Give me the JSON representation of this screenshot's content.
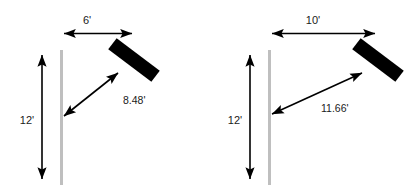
{
  "figure": {
    "title": "",
    "type": "geometry-diagram",
    "unit_symbol": "'",
    "colors": {
      "ink": "#000000",
      "wall": "#bfbfbf",
      "board": "#000000",
      "background": "#ffffff"
    }
  },
  "diagrams": [
    {
      "id": "left",
      "name": "ladder-diagram-left",
      "labels": {
        "horizontal": "6'",
        "vertical": "12'",
        "diagonal": "8.48'"
      },
      "measurements": {
        "horizontal_ft": 6,
        "vertical_ft": 12,
        "diagonal_ft": 8.48
      }
    },
    {
      "id": "right",
      "name": "ladder-diagram-right",
      "labels": {
        "horizontal": "10'",
        "vertical": "12'",
        "diagonal": "11.66'"
      },
      "measurements": {
        "horizontal_ft": 10,
        "vertical_ft": 12,
        "diagonal_ft": 11.66
      }
    }
  ]
}
